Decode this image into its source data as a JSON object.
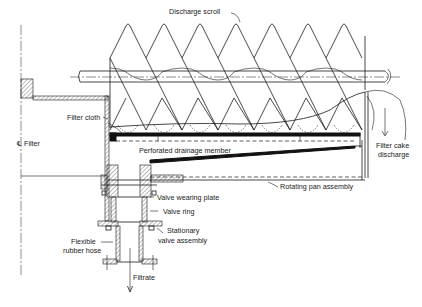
{
  "diagram": {
    "type": "engineering cross-section",
    "labels": {
      "discharge_scroll": "Discharge scroll",
      "filter_cloth": "Filter cloth",
      "filter_centerline": "℄ Filter",
      "perforated_drainage_member": "Perforated drainage member",
      "filter_cake_discharge_line1": "Filter cake",
      "filter_cake_discharge_line2": "discharge",
      "rotating_pan_assembly": "Rotating pan assembly",
      "valve_wearing_plate": "Valve wearing plate",
      "valve_ring": "Valve ring",
      "stationary_valve_assembly_line1": "Stationary",
      "stationary_valve_assembly_line2": "valve assembly",
      "flexible_rubber_hose_line1": "Flexible",
      "flexible_rubber_hose_line2": "rubber hose",
      "filtrate": "Filtrate"
    },
    "colors": {
      "ink": "#1a1a1a",
      "paper": "#ffffff"
    }
  }
}
